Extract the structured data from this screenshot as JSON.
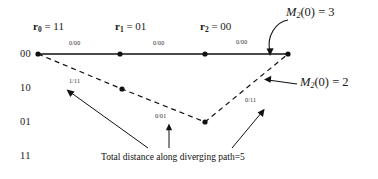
{
  "figure": {
    "caption": "Total distance along diverging path=5"
  },
  "axis": {
    "states": [
      {
        "label": "00",
        "y": 54
      },
      {
        "label": "10",
        "y": 88
      },
      {
        "label": "01",
        "y": 122
      },
      {
        "label": "11",
        "y": 156
      }
    ]
  },
  "received": [
    {
      "name": "r",
      "index": "0",
      "eq": "=",
      "value": "11",
      "x": 38
    },
    {
      "name": "r",
      "index": "1",
      "eq": "=",
      "value": "01",
      "x": 120
    },
    {
      "name": "r",
      "index": "2",
      "eq": "=",
      "value": "00",
      "x": 205
    }
  ],
  "branch_labels": {
    "correct_path": [
      {
        "text": "0/00",
        "x": 79,
        "y": 44
      },
      {
        "text": "0/00",
        "x": 163,
        "y": 44
      },
      {
        "text": "0/00",
        "x": 246,
        "y": 43
      }
    ],
    "diverging_path": [
      {
        "text": "1/11",
        "x": 79,
        "y": 82
      },
      {
        "text": "0/01",
        "x": 164,
        "y": 117
      },
      {
        "text": "0/11",
        "x": 253,
        "y": 101
      }
    ]
  },
  "metrics": [
    {
      "name": "M",
      "index": "2",
      "arg": "(0)",
      "eq": "=",
      "value": "3",
      "x": 286,
      "y": 12
    },
    {
      "name": "M",
      "index": "2",
      "arg": "(0)",
      "eq": "=",
      "value": "2",
      "x": 300,
      "y": 80
    }
  ],
  "nodes": {
    "correct": [
      {
        "x": 38,
        "y": 54
      },
      {
        "x": 120,
        "y": 54
      },
      {
        "x": 205,
        "y": 54
      },
      {
        "x": 288,
        "y": 54
      }
    ],
    "diverging": [
      {
        "x": 38,
        "y": 54
      },
      {
        "x": 122,
        "y": 89
      },
      {
        "x": 205,
        "y": 122
      },
      {
        "x": 288,
        "y": 54
      }
    ]
  },
  "colors": {
    "ink": "#111111",
    "background": "#ffffff"
  }
}
